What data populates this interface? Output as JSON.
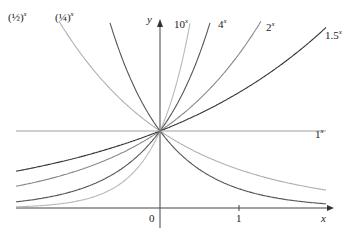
{
  "chart_data": {
    "type": "line",
    "title": "",
    "xlabel": "x",
    "ylabel": "y",
    "xlim": [
      -1.82,
      2.1
    ],
    "ylim": [
      -0.4,
      2.7
    ],
    "x_ticks": [
      "0",
      "1"
    ],
    "grid": false,
    "series": [
      {
        "name": "(1/2)^x",
        "base": 0.5,
        "color": "#b0b0b0"
      },
      {
        "name": "(1/4)^x",
        "base": 0.25,
        "color": "#555555"
      },
      {
        "name": "10^x",
        "base": 10,
        "color": "#b8b8b8"
      },
      {
        "name": "4^x",
        "base": 4,
        "color": "#555555"
      },
      {
        "name": "2^x",
        "base": 2,
        "color": "#888888"
      },
      {
        "name": "1.5^x",
        "base": 1.5,
        "color": "#333333"
      },
      {
        "name": "1^x",
        "base": 1,
        "color": "#a0a0a0"
      }
    ],
    "annotations": [
      "All curves pass through (0, 1)"
    ]
  },
  "labels": {
    "half": "x",
    "quarter": "x",
    "ten": "10",
    "four": "4",
    "two": "2",
    "onefive": "1.5",
    "one": "1",
    "exp": "x",
    "y_axis": "y",
    "x_axis": "x",
    "origin": "0",
    "tick1": "1"
  }
}
